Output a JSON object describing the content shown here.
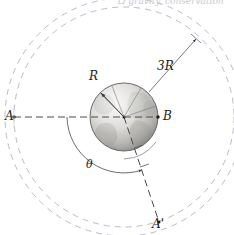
{
  "figure": {
    "caption_fragment": "Ω  gravity,  conservation",
    "background_color": "#ffffff",
    "ink_color": "#1c1c20",
    "orbit_color": "#b9b6c6",
    "globe_light": "#e4e3e0",
    "globe_dark": "#9b9a97",
    "globe_outline": "#6f6e6c"
  },
  "labels": {
    "point_a": "A",
    "point_b": "B",
    "point_a_prime": "A'",
    "radius_r": "R",
    "radius_3r": "3R",
    "angle_theta": "θ"
  },
  "geometry": {
    "center_x": 124,
    "center_y": 117,
    "earth_radius_px": 34,
    "inner_orbit_radius_px": 110,
    "outer_orbit_radius_px": 119,
    "point_a_x": 14,
    "point_a_y": 117,
    "point_b_x": 158,
    "point_b_y": 117,
    "point_a_prime_x": 159,
    "point_a_prime_y": 222
  },
  "annotations": {
    "earth_surface_label": "R",
    "orbit_radius_label": "3R",
    "swept_angle_label": "θ"
  }
}
